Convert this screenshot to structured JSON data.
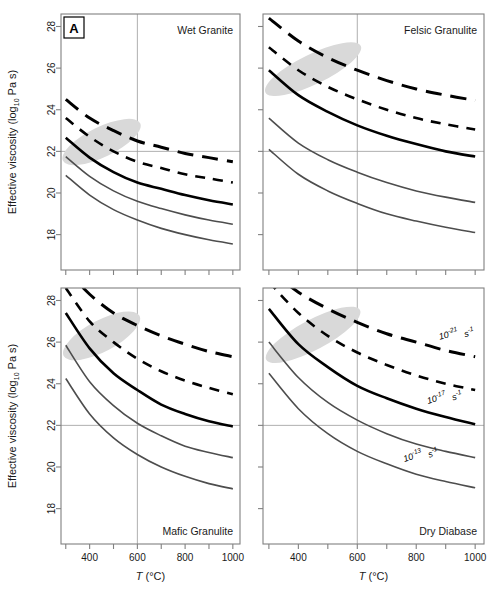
{
  "figure": {
    "panel_letter": "A",
    "y_axis_label_main": "Effective viscosity  (log",
    "y_axis_label_sub": "10",
    "y_axis_label_tail": " Pa s)",
    "x_axis_label_main": "T",
    "x_axis_label_units": " (°C)",
    "background": "#ffffff",
    "frame_color": "#808080",
    "gridline_color": "#9a9a9a",
    "dark_curve_color": "#000000",
    "grey_curve_color": "#4d4d4d",
    "shade_color": "#d9d9d9"
  },
  "axes": {
    "x_ticks": [
      300,
      400,
      500,
      600,
      700,
      800,
      900,
      1000
    ],
    "x_tick_labels": [
      "",
      "400",
      "",
      "600",
      "",
      "800",
      "",
      "1000"
    ],
    "x_range": [
      280,
      1030
    ],
    "y_ticks": [
      18,
      20,
      22,
      24,
      26,
      28
    ],
    "y_tick_labels": [
      "18",
      "20",
      "22",
      "24",
      "26",
      "28"
    ],
    "y_range": [
      16.3,
      28.6
    ],
    "grid_x": 600,
    "grid_y": 22
  },
  "rate_labels": [
    {
      "base": "10",
      "exp": "-21",
      "unit": "s",
      "unit_exp": "-1"
    },
    {
      "base": "10",
      "exp": "-17",
      "unit": "s",
      "unit_exp": "-1"
    },
    {
      "base": "10",
      "exp": "-13",
      "unit": "s",
      "unit_exp": "-1"
    }
  ],
  "chart_data": {
    "type": "line",
    "title": "",
    "xlabel": "T (°C)",
    "ylabel": "Effective viscosity (log10 Pa s)",
    "xlim": [
      280,
      1030
    ],
    "ylim": [
      16.3,
      28.6
    ],
    "grid": true,
    "legend_position": "inline-annotation-bottom-right-panel",
    "x": [
      300,
      400,
      500,
      600,
      700,
      800,
      900,
      1000
    ],
    "panels": [
      {
        "name": "wet-granite",
        "label": "Wet Granite",
        "position": "top-left",
        "shaded_region": {
          "comment": "grey ellipse of geologically relevant conditions",
          "cx": 450,
          "cy": 22.45,
          "rx": 180,
          "ry": 0.72,
          "rotation_deg": -26
        },
        "series": [
          {
            "name": "10^-21 s^-1",
            "style": "dashed-long",
            "color": "#000000",
            "width": 3.0,
            "values": [
              24.5,
              23.6,
              23.0,
              22.5,
              22.2,
              21.9,
              21.7,
              21.5
            ]
          },
          {
            "name": "10^-19 s^-1",
            "style": "dashed-short",
            "color": "#000000",
            "width": 2.6,
            "values": [
              23.6,
              22.7,
              22.0,
              21.5,
              21.2,
              20.9,
              20.7,
              20.5
            ]
          },
          {
            "name": "10^-17 s^-1",
            "style": "solid",
            "color": "#000000",
            "width": 2.6,
            "values": [
              22.65,
              21.7,
              21.0,
              20.5,
              20.2,
              19.9,
              19.65,
              19.45
            ]
          },
          {
            "name": "10^-15 s^-1",
            "style": "solid-grey",
            "color": "#4d4d4d",
            "width": 1.6,
            "values": [
              21.75,
              20.8,
              20.1,
              19.6,
              19.25,
              18.95,
              18.7,
              18.5
            ]
          },
          {
            "name": "10^-13 s^-1",
            "style": "solid-grey",
            "color": "#4d4d4d",
            "width": 1.6,
            "values": [
              20.85,
              19.9,
              19.2,
              18.7,
              18.3,
              18.0,
              17.75,
              17.55
            ]
          }
        ]
      },
      {
        "name": "felsic-granulite",
        "label": "Felsic Granulite",
        "position": "top-right",
        "shaded_region": {
          "cx": 450,
          "cy": 25.95,
          "rx": 180,
          "ry": 0.72,
          "rotation_deg": -26
        },
        "series": [
          {
            "name": "10^-21 s^-1",
            "style": "dashed-long",
            "color": "#000000",
            "width": 3.0,
            "values": [
              28.4,
              27.3,
              26.5,
              25.9,
              25.4,
              25.0,
              24.7,
              24.45
            ]
          },
          {
            "name": "10^-19 s^-1",
            "style": "dashed-short",
            "color": "#000000",
            "width": 2.6,
            "values": [
              27.0,
              25.9,
              25.1,
              24.5,
              24.0,
              23.6,
              23.3,
              23.05
            ]
          },
          {
            "name": "10^-17 s^-1",
            "style": "solid",
            "color": "#000000",
            "width": 2.6,
            "values": [
              25.9,
              24.7,
              23.9,
              23.25,
              22.75,
              22.35,
              22.0,
              21.75
            ]
          },
          {
            "name": "10^-15 s^-1",
            "style": "solid-grey",
            "color": "#4d4d4d",
            "width": 1.6,
            "values": [
              23.6,
              22.4,
              21.6,
              21.0,
              20.5,
              20.1,
              19.8,
              19.55
            ]
          },
          {
            "name": "10^-13 s^-1",
            "style": "solid-grey",
            "color": "#4d4d4d",
            "width": 1.6,
            "values": [
              22.1,
              20.9,
              20.1,
              19.5,
              19.0,
              18.65,
              18.35,
              18.1
            ]
          }
        ]
      },
      {
        "name": "mafic-granulite",
        "label": "Mafic Granulite",
        "position": "bottom-left",
        "shaded_region": {
          "cx": 450,
          "cy": 26.3,
          "rx": 180,
          "ry": 0.75,
          "rotation_deg": -28
        },
        "series": [
          {
            "name": "10^-21 s^-1",
            "style": "dashed-long",
            "color": "#000000",
            "width": 3.0,
            "values": [
              29.5,
              28.3,
              27.4,
              26.8,
              26.3,
              25.9,
              25.55,
              25.3
            ]
          },
          {
            "name": "10^-19 s^-1",
            "style": "dashed-short",
            "color": "#000000",
            "width": 2.6,
            "values": [
              28.6,
              27.0,
              26.0,
              25.2,
              24.6,
              24.15,
              23.8,
              23.5
            ]
          },
          {
            "name": "10^-17 s^-1",
            "style": "solid",
            "color": "#000000",
            "width": 2.6,
            "values": [
              27.4,
              25.7,
              24.5,
              23.7,
              23.0,
              22.55,
              22.2,
              21.95
            ]
          },
          {
            "name": "10^-15 s^-1",
            "style": "solid-grey",
            "color": "#4d4d4d",
            "width": 1.6,
            "values": [
              25.85,
              24.1,
              22.95,
              22.1,
              21.5,
              21.0,
              20.7,
              20.45
            ]
          },
          {
            "name": "10^-13 s^-1",
            "style": "solid-grey",
            "color": "#4d4d4d",
            "width": 1.6,
            "values": [
              24.25,
              22.55,
              21.4,
              20.6,
              20.0,
              19.55,
              19.2,
              18.95
            ]
          }
        ]
      },
      {
        "name": "dry-diabase",
        "label": "Dry Diabase",
        "position": "bottom-right",
        "shaded_region": {
          "cx": 450,
          "cy": 26.35,
          "rx": 180,
          "ry": 0.72,
          "rotation_deg": -28
        },
        "series": [
          {
            "name": "10^-21 s^-1",
            "style": "dashed-long",
            "color": "#000000",
            "width": 3.0,
            "values": [
              29.5,
              28.4,
              27.6,
              26.95,
              26.4,
              26.0,
              25.6,
              25.3
            ]
          },
          {
            "name": "10^-19 s^-1",
            "style": "dashed-short",
            "color": "#000000",
            "width": 2.6,
            "values": [
              28.9,
              27.4,
              26.3,
              25.5,
              24.9,
              24.4,
              24.0,
              23.7
            ]
          },
          {
            "name": "10^-17 s^-1",
            "style": "solid",
            "color": "#000000",
            "width": 2.6,
            "values": [
              27.6,
              25.9,
              24.8,
              23.9,
              23.3,
              22.8,
              22.4,
              22.05
            ]
          },
          {
            "name": "10^-15 s^-1",
            "style": "solid-grey",
            "color": "#4d4d4d",
            "width": 1.6,
            "values": [
              26.0,
              24.3,
              23.1,
              22.25,
              21.6,
              21.1,
              20.75,
              20.45
            ]
          },
          {
            "name": "10^-13 s^-1",
            "style": "solid-grey",
            "color": "#4d4d4d",
            "width": 1.6,
            "values": [
              24.5,
              22.8,
              21.6,
              20.75,
              20.15,
              19.65,
              19.3,
              19.0
            ]
          }
        ]
      }
    ]
  }
}
